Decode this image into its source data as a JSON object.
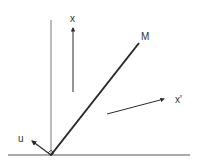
{
  "diagram": {
    "type": "vector-geometry",
    "colors": {
      "stroke": "#2a2a2a",
      "ground": "#555555",
      "background": "#ffffff"
    },
    "labels": {
      "x": "x",
      "m": "M",
      "x_prime": "x'",
      "u": "u"
    },
    "elements": [
      {
        "id": "ground-line",
        "from": [
          8,
          155
        ],
        "to": [
          190,
          155
        ]
      },
      {
        "id": "vertical-line",
        "from": [
          51,
          155
        ],
        "to": [
          51,
          20
        ]
      },
      {
        "id": "segment-OM",
        "from": [
          51,
          155
        ],
        "to": [
          139,
          43
        ],
        "label": "M"
      },
      {
        "id": "vector-x",
        "from": [
          73,
          92
        ],
        "to": [
          73,
          25
        ],
        "label": "x"
      },
      {
        "id": "vector-x-prime",
        "from": [
          107,
          114
        ],
        "to": [
          166,
          98
        ],
        "label": "x'"
      },
      {
        "id": "vector-u",
        "from": [
          51,
          155
        ],
        "to": [
          30,
          140
        ],
        "label": "u"
      },
      {
        "id": "right-angle-marker",
        "at": [
          51,
          155
        ]
      }
    ]
  }
}
